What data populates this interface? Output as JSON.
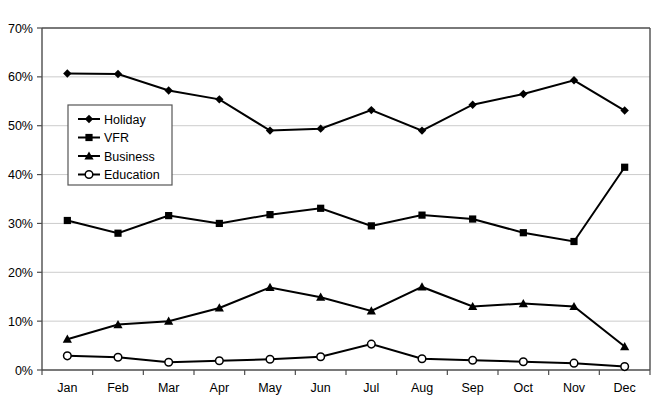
{
  "chart_data": {
    "type": "line",
    "title": "",
    "xlabel": "",
    "ylabel": "",
    "grid": true,
    "legend_position": "inside-upper-left",
    "categories": [
      "Jan",
      "Feb",
      "Mar",
      "Apr",
      "May",
      "Jun",
      "Jul",
      "Aug",
      "Sep",
      "Oct",
      "Nov",
      "Dec"
    ],
    "ylim": [
      0,
      70
    ],
    "ytick_labels": [
      "0%",
      "10%",
      "20%",
      "30%",
      "40%",
      "50%",
      "60%",
      "70%"
    ],
    "ytick_values": [
      0,
      10,
      20,
      30,
      40,
      50,
      60,
      70
    ],
    "series": [
      {
        "name": "Holiday",
        "marker": "diamond",
        "color": "#000000",
        "values": [
          60.7,
          60.6,
          57.2,
          55.4,
          49.0,
          49.4,
          53.2,
          49.0,
          54.3,
          56.5,
          59.3,
          53.1
        ]
      },
      {
        "name": "VFR",
        "marker": "square",
        "color": "#000000",
        "values": [
          30.6,
          28.0,
          31.6,
          30.0,
          31.8,
          33.1,
          29.5,
          31.7,
          30.9,
          28.1,
          26.3,
          41.5
        ]
      },
      {
        "name": "Business",
        "marker": "triangle",
        "color": "#000000",
        "values": [
          6.3,
          9.3,
          10.0,
          12.7,
          16.9,
          14.9,
          12.1,
          17.0,
          13.0,
          13.6,
          13.0,
          4.8
        ]
      },
      {
        "name": "Education",
        "marker": "circle-open",
        "color": "#000000",
        "values": [
          2.9,
          2.6,
          1.6,
          1.9,
          2.2,
          2.7,
          5.3,
          2.3,
          2.0,
          1.7,
          1.4,
          0.7
        ]
      }
    ]
  },
  "legend": {
    "items": [
      {
        "label": "Holiday",
        "marker": "diamond"
      },
      {
        "label": "VFR",
        "marker": "square"
      },
      {
        "label": "Business",
        "marker": "triangle"
      },
      {
        "label": "Education",
        "marker": "circle-open"
      }
    ]
  },
  "axis": {
    "y_labels": [
      "70%",
      "60%",
      "50%",
      "40%",
      "30%",
      "20%",
      "10%",
      "0%"
    ],
    "x_labels": [
      "Jan",
      "Feb",
      "Mar",
      "Apr",
      "May",
      "Jun",
      "Jul",
      "Aug",
      "Sep",
      "Oct",
      "Nov",
      "Dec"
    ]
  }
}
